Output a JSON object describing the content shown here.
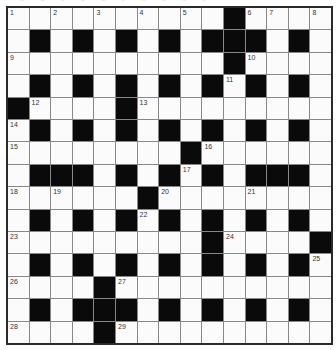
{
  "puzzle": {
    "title_fragment": "▪ ▪ ▪ ▪ ▪ ▪ ▪ ▪ ▪ ▪",
    "size": {
      "rows": 15,
      "cols": 15
    },
    "colors": {
      "block": "#0a0a0a",
      "cell": "#fbfbfb",
      "border": "#2a2a2a",
      "number": "#333333"
    },
    "rows": [
      "..........#....",
      ".#.#.#.#.###.#.",
      "..........#....",
      ".#.#.#.#.#.#.#.",
      "#....#.........",
      ".#.#.#.#.#.#.#.",
      "........#......",
      ".###.#.#.#.###.",
      "......#........",
      ".#.#.#.#.#.#.#.",
      ".........#....#",
      ".#.#.#.#.#.#.#.",
      "....#..........",
      ".#.###.#.#.#.#.",
      "....#.........."
    ],
    "numbers": [
      {
        "n": "1",
        "r": 0,
        "c": 0
      },
      {
        "n": "2",
        "r": 0,
        "c": 2
      },
      {
        "n": "3",
        "r": 0,
        "c": 4
      },
      {
        "n": "4",
        "r": 0,
        "c": 6
      },
      {
        "n": "5",
        "r": 0,
        "c": 8
      },
      {
        "n": "6",
        "r": 0,
        "c": 11
      },
      {
        "n": "7",
        "r": 0,
        "c": 12
      },
      {
        "n": "8",
        "r": 0,
        "c": 14
      },
      {
        "n": "9",
        "r": 2,
        "c": 0
      },
      {
        "n": "10",
        "r": 2,
        "c": 11
      },
      {
        "n": "11",
        "r": 3,
        "c": 10
      },
      {
        "n": "12",
        "r": 4,
        "c": 1
      },
      {
        "n": "13",
        "r": 4,
        "c": 6
      },
      {
        "n": "14",
        "r": 5,
        "c": 0
      },
      {
        "n": "15",
        "r": 6,
        "c": 0
      },
      {
        "n": "16",
        "r": 6,
        "c": 9
      },
      {
        "n": "17",
        "r": 7,
        "c": 8
      },
      {
        "n": "18",
        "r": 8,
        "c": 0
      },
      {
        "n": "19",
        "r": 8,
        "c": 2
      },
      {
        "n": "20",
        "r": 8,
        "c": 7
      },
      {
        "n": "21",
        "r": 8,
        "c": 11
      },
      {
        "n": "22",
        "r": 9,
        "c": 6
      },
      {
        "n": "23",
        "r": 10,
        "c": 0
      },
      {
        "n": "24",
        "r": 10,
        "c": 10
      },
      {
        "n": "25",
        "r": 11,
        "c": 14
      },
      {
        "n": "26",
        "r": 12,
        "c": 0
      },
      {
        "n": "27",
        "r": 12,
        "c": 5
      },
      {
        "n": "28",
        "r": 14,
        "c": 0
      },
      {
        "n": "29",
        "r": 14,
        "c": 5
      }
    ]
  }
}
